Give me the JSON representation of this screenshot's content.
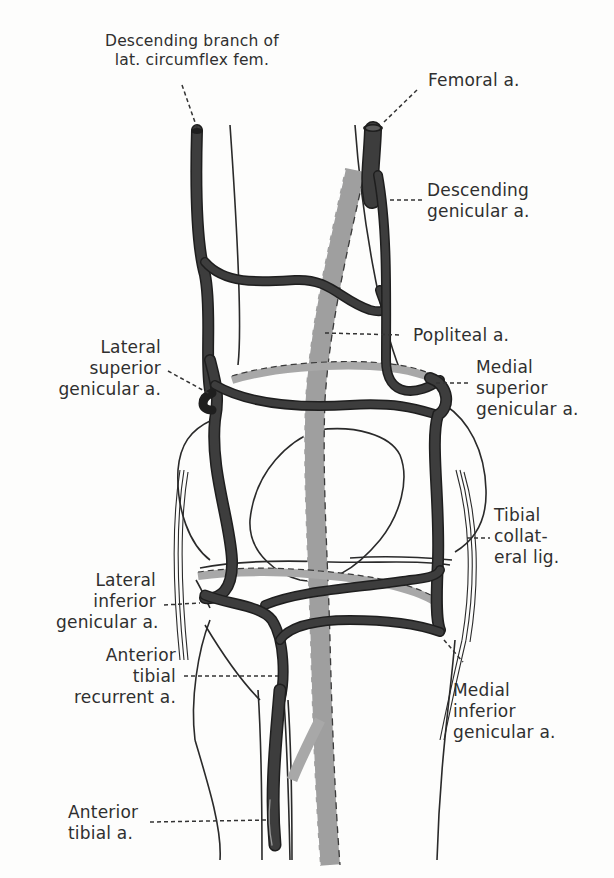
{
  "diagram": {
    "colors": {
      "artery_anterior": "#3a3a3a",
      "artery_posterior": "#a8a8a8",
      "outline": "#2a2a2a",
      "background": "#fdfdfc",
      "label_text": "#2f2f2f"
    },
    "labels": {
      "desc_branch_lat_circumflex": "Descending branch of\nlat. circumflex fem.",
      "femoral": "Femoral a.",
      "descending_genicular": "Descending\ngenicular a.",
      "popliteal": "Popliteal a.",
      "lateral_superior_genicular": "Lateral\nsuperior\ngenicular a.",
      "medial_superior_genicular": "Medial\nsuperior\ngenicular a.",
      "tibial_collateral_lig": "Tibial\ncollat-\neral lig.",
      "lateral_inferior_genicular": "Lateral\ninferior\ngenicular a.",
      "anterior_tibial_recurrent": "Anterior\ntibial\nrecurrent a.",
      "medial_inferior_genicular": "Medial\ninferior\ngenicular a.",
      "anterior_tibial": "Anterior\ntibial a."
    }
  }
}
